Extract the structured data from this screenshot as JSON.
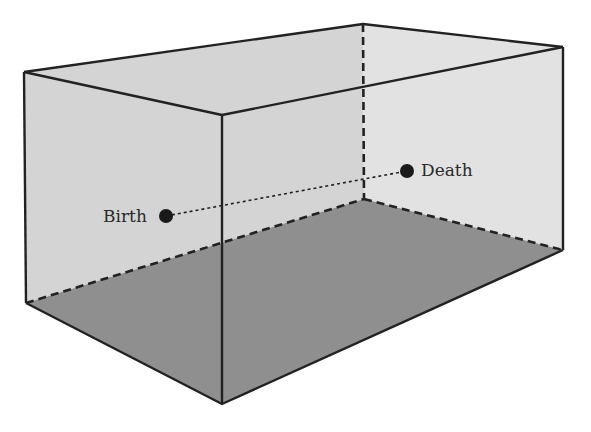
{
  "diagram": {
    "type": "3d-box-room",
    "colors": {
      "left_back_wall": "#d4d4d4",
      "right_back_wall": "#e2e2e2",
      "floor": "#8f8f8f",
      "edge": "#222222",
      "point": "#1a1a1a"
    },
    "points": [
      {
        "id": "birth",
        "label": "Birth",
        "x": 166,
        "y": 216
      },
      {
        "id": "death",
        "label": "Death",
        "x": 407,
        "y": 171
      }
    ],
    "connector": {
      "style": "dotted",
      "from": "birth",
      "to": "death"
    }
  }
}
